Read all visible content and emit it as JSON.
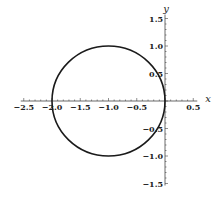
{
  "chart_data": {
    "type": "line",
    "title": "",
    "xlabel": "x",
    "ylabel": "y",
    "xlim": [
      -2.5,
      0.5
    ],
    "ylim": [
      -1.5,
      1.5
    ],
    "grid": false,
    "legend": null,
    "x_ticks": [
      -2.5,
      -2.0,
      -1.5,
      -1.0,
      -0.5,
      0.5
    ],
    "x_tick_labels": [
      "-2.5",
      "-2.0",
      "-1.5",
      "-1.0",
      "-0.5",
      "0.5"
    ],
    "y_ticks": [
      1.5,
      1.0,
      0.5,
      -0.5,
      -1.0,
      -1.5
    ],
    "y_tick_labels": [
      "1.5",
      "1.0",
      "0.5",
      "-0.5",
      "-1.0",
      "-1.5"
    ],
    "series": [
      {
        "name": "circle",
        "shape": "circle",
        "center": [
          -1,
          0
        ],
        "radius": 1,
        "color": "#1a1a1a"
      }
    ]
  }
}
